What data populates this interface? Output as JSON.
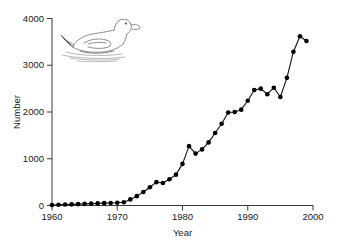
{
  "figure": {
    "background_color": "#ffffff",
    "line_color": "#111111",
    "marker_color": "#000000",
    "axis_color": "#3a3a3a",
    "illustration_color": "#6e6e6e"
  },
  "illustration": {
    "name": "duck-illustration",
    "subject": "duck swimming on water",
    "style": "line drawing"
  },
  "axis": {
    "x_title": "Year",
    "y_title": "Number",
    "x_ticks": [
      "1960",
      "1970",
      "1980",
      "1990",
      "2000"
    ],
    "y_ticks": [
      "0",
      "1000",
      "2000",
      "3000",
      "4000"
    ]
  },
  "chart_data": {
    "type": "line",
    "title": "",
    "subtitle": "",
    "xlabel": "Year",
    "ylabel": "Number",
    "xlim": [
      1960,
      2000
    ],
    "ylim": [
      0,
      4000
    ],
    "xticks": [
      1960,
      1970,
      1980,
      1990,
      2000
    ],
    "yticks": [
      0,
      1000,
      2000,
      3000,
      4000
    ],
    "grid": false,
    "legend": null,
    "markers": "filled-circle",
    "x": [
      1960,
      1961,
      1962,
      1963,
      1964,
      1965,
      1966,
      1967,
      1968,
      1969,
      1970,
      1971,
      1972,
      1973,
      1974,
      1975,
      1976,
      1977,
      1978,
      1979,
      1980,
      1981,
      1982,
      1983,
      1984,
      1985,
      1986,
      1987,
      1988,
      1989,
      1990,
      1991,
      1992,
      1993,
      1994,
      1995,
      1996,
      1997,
      1998,
      1999
    ],
    "values": [
      10,
      15,
      20,
      25,
      30,
      35,
      40,
      45,
      50,
      55,
      60,
      70,
      130,
      200,
      290,
      390,
      500,
      480,
      560,
      660,
      890,
      1270,
      1110,
      1200,
      1350,
      1550,
      1750,
      1990,
      2000,
      2050,
      2240,
      2470,
      2500,
      2380,
      2520,
      2320,
      2730,
      3290,
      3620,
      3520
    ],
    "series": [
      {
        "name": "Number",
        "values": [
          10,
          15,
          20,
          25,
          30,
          35,
          40,
          45,
          50,
          55,
          60,
          70,
          130,
          200,
          290,
          390,
          500,
          480,
          560,
          660,
          890,
          1270,
          1110,
          1200,
          1350,
          1550,
          1750,
          1990,
          2000,
          2050,
          2240,
          2470,
          2500,
          2380,
          2520,
          2320,
          2730,
          3290,
          3620,
          3520
        ]
      }
    ],
    "annotations": []
  }
}
